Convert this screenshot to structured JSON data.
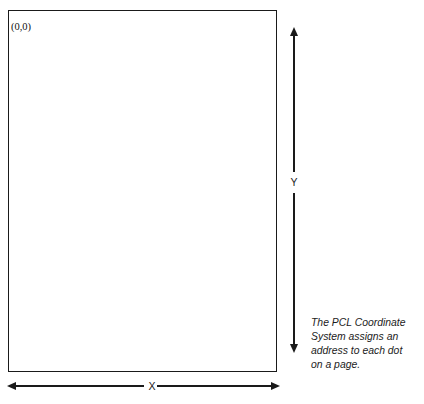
{
  "figure": {
    "top_caption_fragment": "FIGURE 4-1",
    "origin_label": "(0,0)",
    "axes": {
      "vertical": {
        "label": "Y",
        "icon_up": "arrow-up-icon",
        "icon_down": "arrow-down-icon"
      },
      "horizontal": {
        "label": "X",
        "icon_left": "arrow-left-icon",
        "icon_right": "arrow-right-icon"
      }
    },
    "page_area": {
      "name": "printable-page-rectangle"
    },
    "caption": {
      "lines": [
        "The PCL Coordinate",
        "System assigns an",
        "address to each dot",
        "on a page."
      ],
      "full_text": "The PCL Coordinate System assigns an address to each dot on a page."
    },
    "colors": {
      "ink": "#1a1a1a",
      "background": "#ffffff"
    }
  }
}
